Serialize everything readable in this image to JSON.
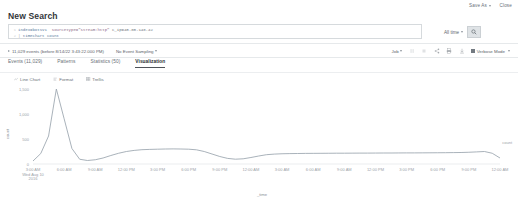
{
  "topbar": {
    "save_as_label": "Save As",
    "close_label": "Close"
  },
  "page_title": "New Search",
  "search": {
    "line1_number": "1",
    "line1_cmd": "index=botsv1",
    "line1_field": "sourcetype=\"stream:http\"",
    "line1_plain": "c_ip=40.80.148.42",
    "line2_number": "2",
    "line2_pipe": "|",
    "line2_cmd": "timechart count",
    "time_range_label": "All time",
    "search_icon": "magnifier-icon"
  },
  "resultbar": {
    "event_count_label": "11,029 events (before 8/14/22 3:43:22.000 PM)",
    "sampling_label": "No Event Sampling",
    "job_label": "Job",
    "icons": [
      "pause-icon",
      "stop-icon",
      "share-icon",
      "print-icon",
      "download-icon"
    ],
    "verbose_label": "Verbose Mode"
  },
  "tabs": [
    {
      "label": "Events (11,029)",
      "active": false,
      "name": "tab-events"
    },
    {
      "label": "Patterns",
      "active": false,
      "name": "tab-patterns"
    },
    {
      "label": "Statistics (50)",
      "active": false,
      "name": "tab-statistics"
    },
    {
      "label": "Visualization",
      "active": true,
      "name": "tab-visualization"
    }
  ],
  "viz_controls": [
    {
      "label": "Line Chart",
      "icon": "line-chart-icon",
      "name": "chart-type-selector"
    },
    {
      "label": "Format",
      "icon": "format-icon",
      "name": "format-button"
    },
    {
      "label": "Trellis",
      "icon": "trellis-icon",
      "name": "trellis-button"
    }
  ],
  "chart_data": {
    "type": "line",
    "title": "",
    "xlabel": "_time",
    "ylabel": "count",
    "legend": [
      "count"
    ],
    "legend_position": "right",
    "grid": false,
    "ylim": [
      0,
      1500
    ],
    "yticks": [
      0,
      500,
      1000,
      1500
    ],
    "ytick_labels": [
      "0",
      "500",
      "1,000",
      "1,500"
    ],
    "xtick_labels": [
      "3:00 AM\nWed Aug 10\n2016",
      "6:00 AM",
      "9:00 AM",
      "12:00 PM",
      "3:00 PM",
      "6:00 PM",
      "9:00 PM",
      "12:00 AM",
      "3:00 AM",
      "6:00 AM",
      "9:00 AM",
      "12:00 PM",
      "3:00 PM",
      "6:00 PM",
      "9:00 PM",
      "12:00 AM"
    ],
    "series": [
      {
        "name": "count",
        "color": "#99a4ae",
        "x": [
          0,
          1,
          2,
          3,
          4,
          5,
          6,
          7,
          8,
          9,
          10,
          11,
          12,
          13,
          14,
          15,
          16,
          17,
          18,
          19,
          20,
          21,
          22,
          23,
          24,
          25,
          26,
          27,
          28,
          29,
          30,
          31,
          32,
          33,
          34,
          35,
          36,
          37,
          38,
          39,
          40,
          41,
          42,
          43,
          44,
          45,
          46,
          47,
          48,
          49,
          50,
          51,
          52,
          53,
          54,
          55,
          56,
          57,
          58,
          59,
          60
        ],
        "values": [
          60,
          210,
          560,
          1500,
          905,
          310,
          95,
          70,
          85,
          120,
          170,
          215,
          250,
          272,
          286,
          292,
          296,
          300,
          302,
          300,
          296,
          284,
          250,
          200,
          150,
          112,
          96,
          104,
          130,
          160,
          186,
          198,
          205,
          208,
          210,
          212,
          213,
          214,
          215,
          216,
          216,
          217,
          218,
          218,
          219,
          220,
          220,
          221,
          222,
          222,
          223,
          224,
          225,
          226,
          228,
          230,
          235,
          242,
          250,
          215,
          120
        ]
      }
    ]
  }
}
